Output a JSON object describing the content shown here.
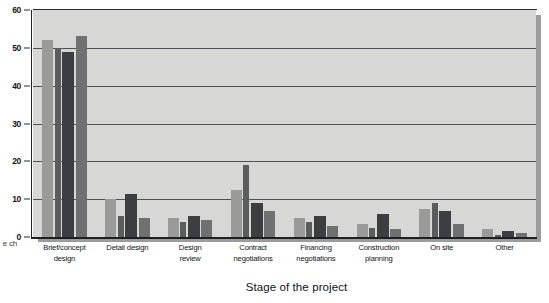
{
  "chart_data": {
    "type": "bar",
    "title": "",
    "xlabel": "Stage of the project",
    "ylabel": "",
    "ylim": [
      0,
      60
    ],
    "yticks": [
      0,
      10,
      20,
      30,
      40,
      50,
      60
    ],
    "grid": true,
    "legend": "none",
    "categories": [
      "Brief/concept design",
      "Detail design",
      "Design review",
      "Contract negotiations",
      "Financing negotiations",
      "Construction planning",
      "On site",
      "Other"
    ],
    "category_lines": [
      [
        "Brief/concept",
        "design"
      ],
      [
        "Detail  design",
        ""
      ],
      [
        "Design",
        "review"
      ],
      [
        "Contract",
        "negotiations"
      ],
      [
        "Financing",
        "negotiations"
      ],
      [
        "Construction",
        "planning"
      ],
      [
        "On  site",
        ""
      ],
      [
        "Other",
        ""
      ]
    ],
    "series": [
      {
        "name": "Series 1",
        "color": "#9a9b99",
        "values": [
          52,
          10,
          5,
          12.5,
          5,
          3.5,
          7.5,
          2
        ]
      },
      {
        "name": "Series 2",
        "color": "#5a5c5e",
        "values": [
          50,
          5.5,
          4,
          19,
          4,
          2.5,
          9,
          0.5
        ]
      },
      {
        "name": "Series 3",
        "color": "#3c3e41",
        "values": [
          49,
          11.5,
          5.5,
          9,
          5.5,
          6,
          7,
          1.5
        ]
      },
      {
        "name": "Series 4",
        "color": "#6e7072",
        "values": [
          53,
          5,
          4.5,
          7,
          3,
          2,
          3.5,
          1
        ]
      }
    ]
  },
  "axis": {
    "left_title_fragment_line1": "e",
    "left_title_fragment_line2": "ch",
    "x_axis_title": "Stage of the project"
  },
  "colors": {
    "plot_background": "#d7d8d6",
    "gridline": "#4e5055",
    "axis_line": "#1d1f23",
    "page_background": "#ffffff",
    "shadow": "#9a9c9e"
  }
}
